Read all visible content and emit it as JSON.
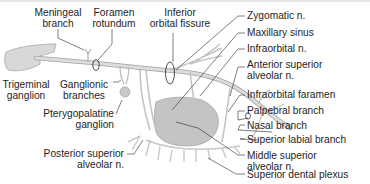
{
  "diagram": {
    "colors": {
      "nerve": "#d4d4d4",
      "nerve_outline": "#9a9a9a",
      "sinus": "#c6c6c6",
      "leader": "#2a2a2a",
      "text": "#1e1e1e"
    },
    "labels": {
      "meningeal_branch": [
        "Meningeal",
        "branch"
      ],
      "foramen_rotundum": [
        "Foramen",
        "rotundum"
      ],
      "inferior_orbital_fissure": [
        "Inferior",
        "orbital fissure"
      ],
      "trigeminal_ganglion": [
        "Trigeminal",
        "ganglion"
      ],
      "ganglionic_branches": [
        "Ganglionic",
        "branches"
      ],
      "pterygopalatine_ganglion": [
        "Pterygopalatine",
        "ganglion"
      ],
      "posterior_superior_alveolar": [
        "Posterior superior",
        "alveolar n."
      ],
      "zygomatic_n": "Zygomatic n.",
      "maxillary_sinus": "Maxillary sinus",
      "infraorbital_n": "Infraorbital n.",
      "anterior_superior_alveolar": [
        "Anterior superior",
        "alveolar n."
      ],
      "infraorbital_foramen": "Infraorbital faramen",
      "palpebral_branch": "Palpebral branch",
      "nasal_branch": "Nasal branch",
      "superior_labial_branch": "Superior labial branch",
      "middle_superior_alveolar": [
        "Middle superior",
        "alveolar n."
      ],
      "superior_dental_plexus": "Superior dental plexus"
    }
  }
}
